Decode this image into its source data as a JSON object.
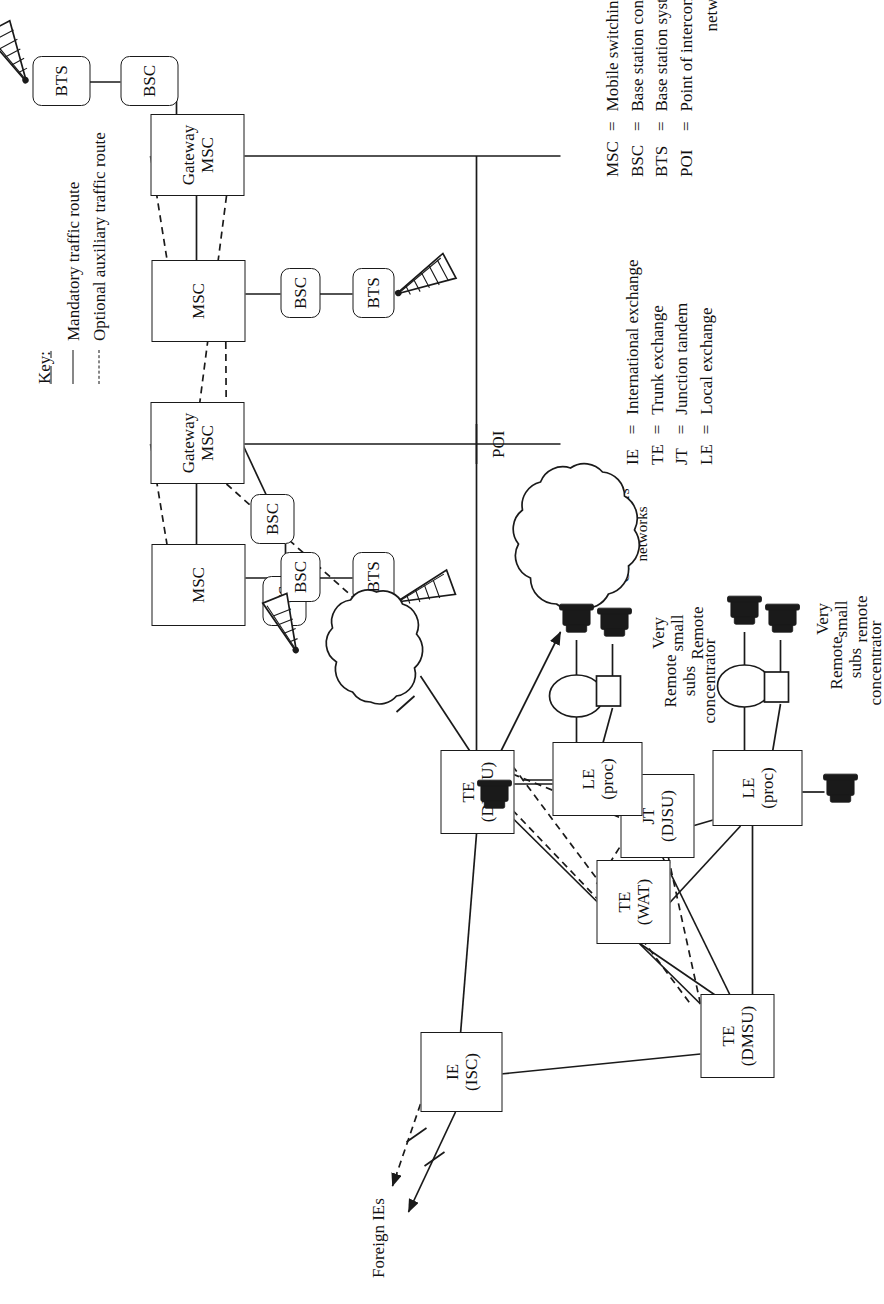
{
  "diagram": {
    "key": {
      "title": "Key:",
      "entries": [
        {
          "style": "solid",
          "label": "Mandatory traffic route"
        },
        {
          "style": "dashed",
          "label": "Optional auxiliary traffic route"
        }
      ]
    },
    "legend_fixed": {
      "rows": [
        {
          "abbr": "IE",
          "eq": "=",
          "def": "International exchange"
        },
        {
          "abbr": "TE",
          "eq": "=",
          "def": "Trunk exchange"
        },
        {
          "abbr": "JT",
          "eq": "=",
          "def": "Junction tandem"
        },
        {
          "abbr": "LE",
          "eq": "=",
          "def": "Local exchange"
        }
      ]
    },
    "legend_mobile": {
      "rows": [
        {
          "abbr": "MSC",
          "eq": "=",
          "def": "Mobile switching system"
        },
        {
          "abbr": "BSC",
          "eq": "=",
          "def": "Base station controller"
        },
        {
          "abbr": "BTS",
          "eq": "=",
          "def": "Base station system"
        },
        {
          "abbr": "POI",
          "eq": "=",
          "def": "Point of interconnection between",
          "cont": "networks"
        }
      ]
    },
    "nodes": {
      "gateway_msc_1": {
        "l1": "Gateway",
        "l2": "MSC"
      },
      "gateway_msc_2": {
        "l1": "Gateway",
        "l2": "MSC"
      },
      "msc_1": {
        "l1": "MSC",
        "l2": ""
      },
      "msc_2": {
        "l1": "MSC",
        "l2": ""
      },
      "bsc_1": {
        "l1": "BSC",
        "l2": ""
      },
      "bsc_2": {
        "l1": "BSC",
        "l2": ""
      },
      "bsc_3": {
        "l1": "BSC",
        "l2": ""
      },
      "bsc_4": {
        "l1": "BSC",
        "l2": ""
      },
      "bts_1": {
        "l1": "BTS",
        "l2": ""
      },
      "bts_2": {
        "l1": "BTS",
        "l2": ""
      },
      "bts_3": {
        "l1": "BTS",
        "l2": ""
      },
      "bts_4": {
        "l1": "BTS",
        "l2": ""
      },
      "ie_isc": {
        "l1": "IE",
        "l2": "(ISC)"
      },
      "te_dmsu_top": {
        "l1": "TE",
        "l2": "(DMSU)"
      },
      "te_dmsu_bottom": {
        "l1": "TE",
        "l2": "(DMSU)"
      },
      "te_wat": {
        "l1": "TE",
        "l2": "(WAT)"
      },
      "jt_djsu": {
        "l1": "JT",
        "l2": "(DJSU)"
      },
      "le_proc_top": {
        "l1": "LE",
        "l2": "(proc)"
      },
      "le_proc_bottom": {
        "l1": "LE",
        "l2": "(proc)"
      }
    },
    "clouds": {
      "other_plmn": {
        "lines": [
          "Other",
          "PLMN"
        ]
      },
      "other_networks": {
        "lines": [
          "Other networks",
          "of the Telco,",
          "Other operators'",
          "networks"
        ]
      }
    },
    "annotations": {
      "poi": "POI",
      "foreign_ies": "Foreign IEs",
      "remote_subs_concentrator_top": [
        "Remote",
        "subs",
        "concentrator"
      ],
      "remote_subs_concentrator_bottom": [
        "Remote",
        "subs",
        "concentrator"
      ],
      "very_small_remote_top": [
        "Very",
        "small",
        "remote"
      ],
      "very_small_remote_bottom": [
        "Very",
        "small",
        "Remote"
      ]
    },
    "colors": {
      "line": "#1a1a1a",
      "background": "#ffffff",
      "text": "#111111"
    }
  }
}
